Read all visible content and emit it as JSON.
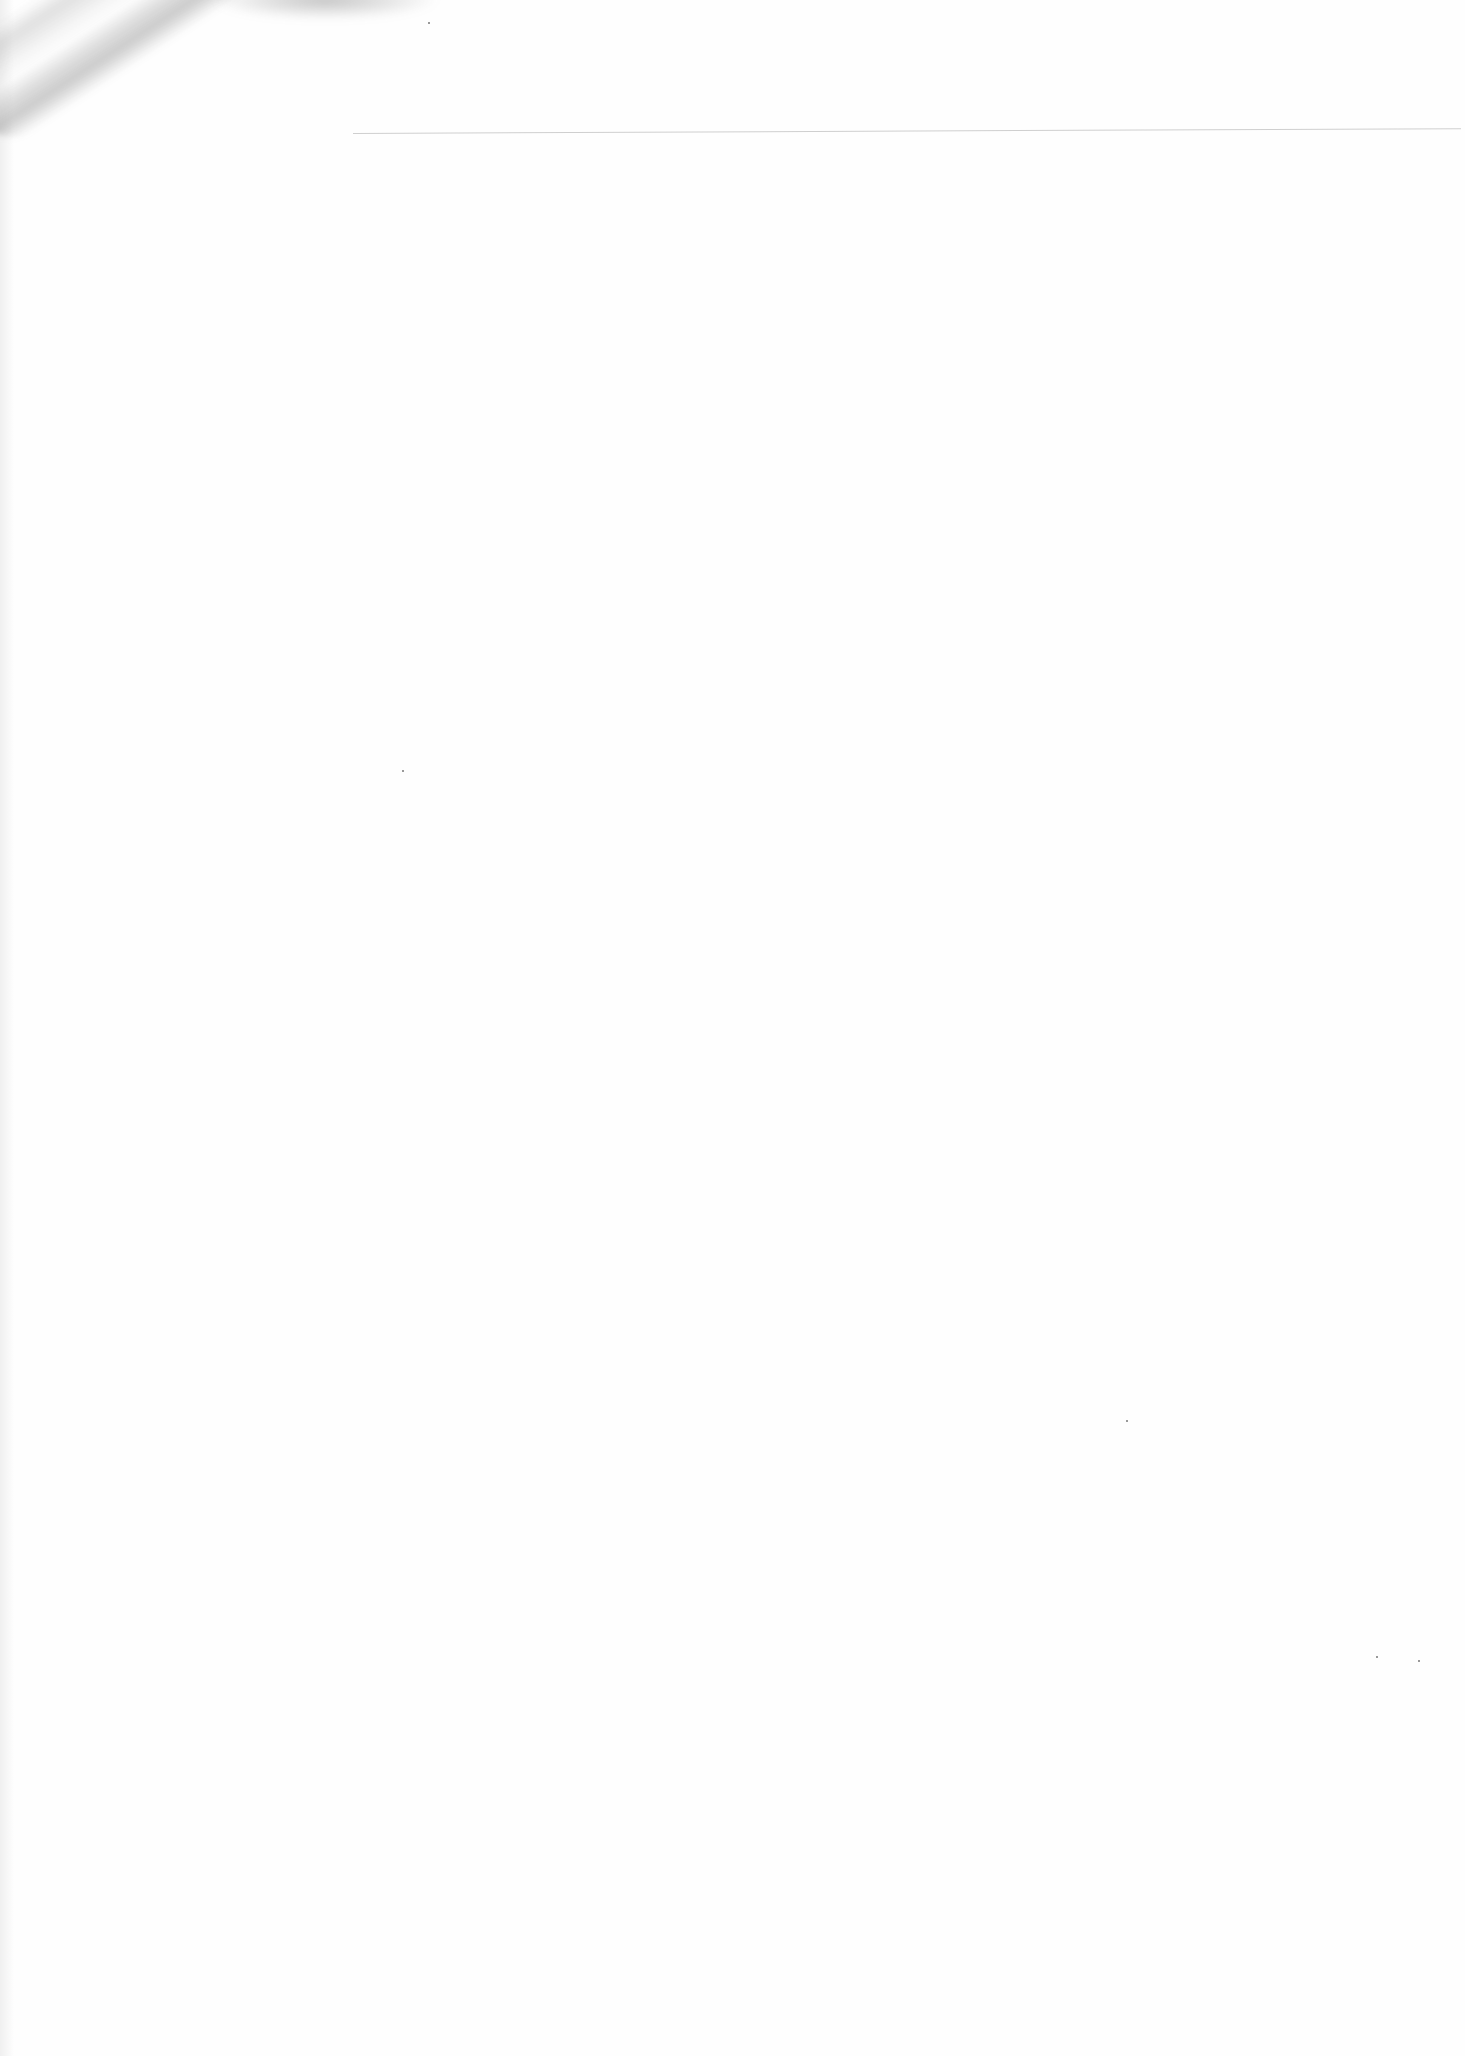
{
  "document": {
    "type": "blank scanned page",
    "text": "",
    "header_rule": {
      "visible": true,
      "color": "#cfcfcf"
    },
    "artifacts": {
      "smudge": "top-left diagonal smudge",
      "specks": [
        {
          "x": 428,
          "y": 22
        },
        {
          "x": 402,
          "y": 770
        },
        {
          "x": 1376,
          "y": 1656
        },
        {
          "x": 1418,
          "y": 1660
        },
        {
          "x": 1126,
          "y": 1420
        }
      ]
    }
  }
}
